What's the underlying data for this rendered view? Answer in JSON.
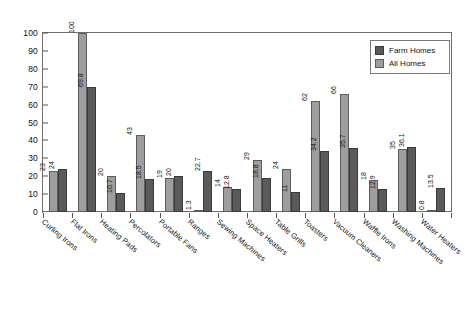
{
  "chart_data": {
    "type": "bar",
    "title": "",
    "subtitle": "",
    "xlabel": "",
    "ylabel": "",
    "ylim": [
      0,
      100
    ],
    "ytick_values": [
      0,
      10,
      20,
      30,
      40,
      50,
      60,
      70,
      80,
      90,
      100
    ],
    "ytick_labels": [
      "0",
      "10",
      "20",
      "30",
      "40",
      "50",
      "60",
      "70",
      "80",
      "90",
      "100"
    ],
    "grid": false,
    "legend_position": "top-right",
    "categories": [
      "Curling Irons",
      "Flat Irons",
      "Heating Pads",
      "Percolators",
      "Portable Fans",
      "Ranges",
      "Sewing Machines",
      "Space Heaters",
      "Table Grills",
      "Toasters",
      "Vacuum Cleaners",
      "Waffle Irons",
      "Washing Machines",
      "Water Heaters"
    ],
    "series": [
      {
        "name": "All Homes",
        "color": "#9e9e9e",
        "draw_order": 1,
        "values": [
          23,
          100,
          20,
          43,
          19,
          1.3,
          14,
          29,
          24,
          62,
          66,
          18,
          35,
          0.8
        ],
        "labels": [
          "23",
          "100",
          "20",
          "43",
          "19",
          "1.3",
          "14",
          "29",
          "24",
          "62",
          "66",
          "18",
          "35",
          "0.8"
        ]
      },
      {
        "name": "Farm Homes",
        "color": "#5a5a5a",
        "draw_order": 2,
        "values": [
          24,
          69.8,
          10.7,
          18.5,
          20,
          22.7,
          12.8,
          18.8,
          11,
          34.2,
          35.7,
          12.9,
          36.1,
          13.5
        ],
        "labels": [
          "24",
          "69.8",
          "10.7",
          "18.5",
          "20",
          "22.7",
          "12.8",
          "18.8",
          "11",
          "34.2",
          "35.7",
          "12.9",
          "36.1",
          "13.5"
        ]
      }
    ]
  },
  "legend": {
    "items": [
      {
        "label": "Farm Homes",
        "swatch": "farm"
      },
      {
        "label": "All Homes",
        "swatch": "all"
      }
    ]
  },
  "colors": {
    "farm_homes": "#5a5a5a",
    "all_homes": "#9e9e9e",
    "axis": "#6e6e6e",
    "background": "#ffffff"
  }
}
